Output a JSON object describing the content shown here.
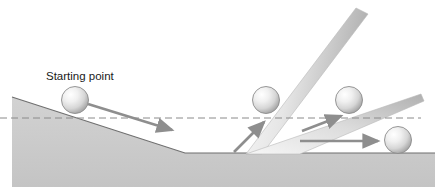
{
  "figure": {
    "title": "",
    "background_color": "#ffffff",
    "width": 435,
    "height": 187
  },
  "labels": {
    "starting_point": "Starting point"
  },
  "colors": {
    "terrain_fill": "#c9c9c9",
    "terrain_edge": "#7a7a7a",
    "wedge_light": "#f2f2f2",
    "wedge_dark": "#b4b4b4",
    "ball_highlight": "#ffffff",
    "ball_mid": "#dcdcdc",
    "ball_edge": "#9a9a9a",
    "ball_outline": "#8c8c8c",
    "arrow_color": "#8e8e8e",
    "arrow_dark": "#7b7b7b",
    "dashed_line": "#8a8a8a",
    "text_color": "#1a1a1a"
  },
  "reference_line": {
    "name": "horizontal-dashed-reference",
    "style": "dashed",
    "y": 118,
    "x_start": 0,
    "x_end": 421
  },
  "ground": {
    "name": "flat-ground",
    "y": 153,
    "x_start": 185,
    "x_end": 435
  },
  "slope": {
    "name": "descending-slope",
    "x_start": 12,
    "y_start": 97,
    "x_end": 185,
    "y_end": 153
  },
  "wedges": [
    {
      "name": "steep-wedge",
      "apex_x": 246,
      "apex_y": 154,
      "tip_x": 356,
      "tip_y": 8,
      "angle_label": "steep"
    },
    {
      "name": "shallow-wedge",
      "apex_x": 246,
      "apex_y": 154,
      "tip_x": 421,
      "tip_y": 94,
      "angle_label": "shallow"
    }
  ],
  "balls": [
    {
      "name": "ball-starting-point",
      "cx": 75,
      "cy": 100,
      "r": 13.5
    },
    {
      "name": "ball-after-steep-bounce",
      "cx": 266,
      "cy": 100,
      "r": 13.5
    },
    {
      "name": "ball-on-shallow-ramp",
      "cx": 349,
      "cy": 100,
      "r": 13.5
    },
    {
      "name": "ball-on-ground",
      "cx": 398,
      "cy": 140,
      "r": 13.5
    }
  ],
  "arrows": [
    {
      "name": "arrow-down-slope",
      "x1": 88,
      "y1": 104,
      "x2": 176,
      "y2": 132,
      "direction": "down-right"
    },
    {
      "name": "arrow-up-steep",
      "x1": 234,
      "y1": 152,
      "x2": 267,
      "y2": 119,
      "direction": "up-right"
    },
    {
      "name": "arrow-up-shallow",
      "x1": 302,
      "y1": 131,
      "x2": 344,
      "y2": 115,
      "direction": "up-right"
    },
    {
      "name": "arrow-horizontal-ground",
      "x1": 300,
      "y1": 141,
      "x2": 382,
      "y2": 141,
      "direction": "right"
    }
  ]
}
